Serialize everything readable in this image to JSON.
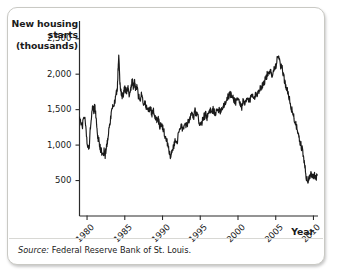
{
  "figure": {
    "source_label": "Source:",
    "source_text": "Federal Reserve Bank of St. Louis.",
    "border_color": "#c9c9c4"
  },
  "chart_data": {
    "type": "line",
    "title": "",
    "ylabel": "New housing starts (thousands)",
    "ylabel_lines": [
      "New housing",
      "starts",
      "(thousands)"
    ],
    "xlabel": "Year",
    "grid": false,
    "legend": null,
    "line_color": "#1a1a1a",
    "axis_color": "#2b2b2b",
    "xlim": [
      1979.0,
      2010.6
    ],
    "ylim": [
      0,
      2750
    ],
    "yticks": [
      500,
      1000,
      1500,
      2000,
      2500
    ],
    "ytick_labels": [
      "500",
      "1,000",
      "1,500",
      "2,000",
      "2,500"
    ],
    "xticks": [
      1980,
      1985,
      1990,
      1995,
      2000,
      2005,
      2010
    ],
    "xtick_labels": [
      "1980",
      "1985",
      "1990",
      "1995",
      "2000",
      "2005",
      "2010"
    ],
    "series_name": "New housing starts",
    "x": [
      1979.0,
      1979.2,
      1979.4,
      1979.6,
      1979.8,
      1980.0,
      1980.15,
      1980.3,
      1980.45,
      1980.6,
      1980.75,
      1980.9,
      1981.05,
      1981.2,
      1981.35,
      1981.5,
      1981.65,
      1981.8,
      1981.95,
      1982.1,
      1982.25,
      1982.4,
      1982.55,
      1982.7,
      1982.85,
      1983.0,
      1983.2,
      1983.4,
      1983.6,
      1983.8,
      1984.0,
      1984.1,
      1984.2,
      1984.35,
      1984.5,
      1984.65,
      1984.8,
      1984.95,
      1985.1,
      1985.25,
      1985.4,
      1985.55,
      1985.7,
      1985.85,
      1986.0,
      1986.15,
      1986.3,
      1986.45,
      1986.6,
      1986.8,
      1987.0,
      1987.2,
      1987.4,
      1987.6,
      1987.8,
      1988.0,
      1988.2,
      1988.4,
      1988.6,
      1988.8,
      1989.0,
      1989.2,
      1989.4,
      1989.6,
      1989.8,
      1990.0,
      1990.2,
      1990.4,
      1990.6,
      1990.8,
      1991.0,
      1991.1,
      1991.3,
      1991.5,
      1991.7,
      1991.9,
      1992.1,
      1992.3,
      1992.5,
      1992.7,
      1992.9,
      1993.1,
      1993.3,
      1993.5,
      1993.7,
      1993.9,
      1994.1,
      1994.3,
      1994.5,
      1994.7,
      1994.9,
      1995.1,
      1995.3,
      1995.5,
      1995.7,
      1995.9,
      1996.1,
      1996.3,
      1996.5,
      1996.7,
      1996.9,
      1997.1,
      1997.3,
      1997.5,
      1997.7,
      1997.9,
      1998.1,
      1998.3,
      1998.5,
      1998.7,
      1998.9,
      1999.1,
      1999.3,
      1999.5,
      1999.7,
      1999.9,
      2000.1,
      2000.3,
      2000.5,
      2000.7,
      2000.9,
      2001.1,
      2001.3,
      2001.5,
      2001.7,
      2001.9,
      2002.1,
      2002.3,
      2002.5,
      2002.7,
      2002.9,
      2003.1,
      2003.3,
      2003.5,
      2003.7,
      2003.9,
      2004.1,
      2004.3,
      2004.5,
      2004.7,
      2004.9,
      2005.1,
      2005.3,
      2005.5,
      2005.7,
      2005.9,
      2006.1,
      2006.3,
      2006.5,
      2006.7,
      2006.9,
      2007.1,
      2007.3,
      2007.5,
      2007.7,
      2007.9,
      2008.1,
      2008.3,
      2008.5,
      2008.7,
      2008.9,
      2009.1,
      2009.3,
      2009.5,
      2009.7,
      2009.9,
      2010.1,
      2010.3,
      2010.5
    ],
    "values": [
      1400,
      1330,
      1280,
      1420,
      1320,
      1030,
      960,
      1010,
      1250,
      1450,
      1530,
      1490,
      1550,
      1380,
      1190,
      1080,
      1020,
      940,
      900,
      870,
      910,
      850,
      980,
      1050,
      1180,
      1300,
      1450,
      1520,
      1600,
      1690,
      1800,
      2040,
      2300,
      1870,
      1760,
      1680,
      1720,
      1780,
      1790,
      1740,
      1820,
      1700,
      1760,
      1840,
      1900,
      1820,
      1890,
      1780,
      1820,
      1700,
      1640,
      1700,
      1600,
      1620,
      1540,
      1560,
      1490,
      1520,
      1430,
      1480,
      1420,
      1350,
      1390,
      1270,
      1300,
      1250,
      1180,
      1120,
      1050,
      960,
      880,
      800,
      930,
      1000,
      1060,
      1020,
      1150,
      1200,
      1260,
      1230,
      1300,
      1250,
      1290,
      1340,
      1400,
      1450,
      1380,
      1480,
      1430,
      1390,
      1320,
      1280,
      1350,
      1400,
      1430,
      1390,
      1440,
      1480,
      1460,
      1500,
      1470,
      1450,
      1490,
      1520,
      1480,
      1530,
      1560,
      1600,
      1640,
      1680,
      1720,
      1700,
      1670,
      1640,
      1610,
      1660,
      1630,
      1580,
      1540,
      1620,
      1570,
      1620,
      1660,
      1600,
      1680,
      1720,
      1700,
      1690,
      1720,
      1760,
      1800,
      1820,
      1860,
      1900,
      1950,
      2000,
      1980,
      2040,
      2000,
      2060,
      2100,
      2150,
      2270,
      2180,
      2100,
      2060,
      1950,
      1850,
      1780,
      1690,
      1620,
      1500,
      1440,
      1350,
      1280,
      1180,
      1080,
      1020,
      940,
      820,
      660,
      520,
      490,
      560,
      590,
      560,
      590,
      540,
      580
    ],
    "annotations": {
      "peak_1984": 2300,
      "trough_1982": 850,
      "trough_1991": 800,
      "peak_2005": 2270,
      "trough_2009": 490
    }
  }
}
